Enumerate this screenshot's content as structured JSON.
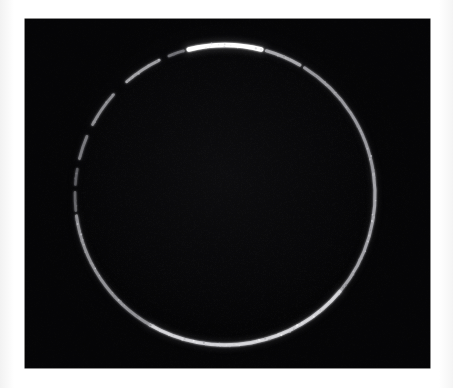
{
  "figure": {
    "caption": "",
    "panel": {
      "label": "astronomical-image-panel",
      "background_color": "#050505",
      "border_color": "#1a1a1a",
      "x": 25,
      "y": 19,
      "width": 405,
      "height": 349
    },
    "page_background_color": "#ffffff"
  },
  "chart_data": {
    "type": "scatter",
    "title": "",
    "subtitle": "",
    "xlabel": "",
    "ylabel": "",
    "grid": false,
    "legend": null,
    "colormap": "grayscale",
    "background": "#050505",
    "object": {
      "name": "luminous-ring",
      "geometry": "annulus",
      "center_x": 200,
      "center_y": 176,
      "radius": 150,
      "ring_width_px": 3.2,
      "units": "pixels"
    },
    "segments": [
      {
        "name": "peak-arc-top",
        "start_deg": 256,
        "end_deg": 284,
        "brightness": 1.0,
        "width": 4.6
      },
      {
        "name": "arc-top-right",
        "start_deg": 286,
        "end_deg": 300,
        "brightness": 0.62,
        "width": 3.0
      },
      {
        "name": "arc-right-upper",
        "start_deg": 302,
        "end_deg": 352,
        "brightness": 0.55,
        "width": 3.0
      },
      {
        "name": "arc-right-lower",
        "start_deg": 352,
        "end_deg": 40,
        "brightness": 0.6,
        "width": 3.0
      },
      {
        "name": "arc-bottom",
        "start_deg": 40,
        "end_deg": 120,
        "brightness": 0.78,
        "width": 3.4
      },
      {
        "name": "arc-left-lower",
        "start_deg": 120,
        "end_deg": 172,
        "brightness": 0.52,
        "width": 3.0
      },
      {
        "name": "dash-left-1",
        "start_deg": 174,
        "end_deg": 181,
        "brightness": 0.34,
        "width": 2.6
      },
      {
        "name": "dash-left-2",
        "start_deg": 184,
        "end_deg": 190,
        "brightness": 0.3,
        "width": 2.6
      },
      {
        "name": "dash-left-3",
        "start_deg": 194,
        "end_deg": 203,
        "brightness": 0.42,
        "width": 2.8
      },
      {
        "name": "dash-upper-left-1",
        "start_deg": 208,
        "end_deg": 222,
        "brightness": 0.5,
        "width": 2.8
      },
      {
        "name": "dash-upper-left-2",
        "start_deg": 229,
        "end_deg": 244,
        "brightness": 0.58,
        "width": 2.8
      },
      {
        "name": "dash-upper-left-3",
        "start_deg": 248,
        "end_deg": 254,
        "brightness": 0.4,
        "width": 2.6
      }
    ],
    "gaps_deg": [
      [
        172,
        174
      ],
      [
        181,
        184
      ],
      [
        190,
        194
      ],
      [
        203,
        208
      ],
      [
        222,
        229
      ],
      [
        244,
        248
      ],
      [
        254,
        256
      ],
      [
        284,
        286
      ]
    ],
    "brightness_scale": {
      "min": 0.0,
      "max": 1.0,
      "peak_color": "#ffffff",
      "mid_color": "#b9bcc2",
      "faint_color": "#4a4d54"
    }
  }
}
